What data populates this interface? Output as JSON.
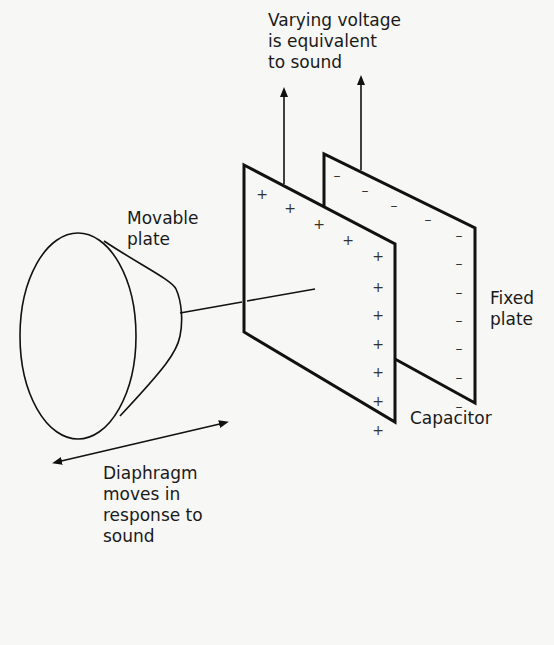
{
  "diagram": {
    "labels": {
      "output": [
        "Varying voltage",
        "is equivalent",
        "to sound"
      ],
      "movable_plate": [
        "Movable",
        "plate"
      ],
      "fixed_plate": [
        "Fixed",
        "plate"
      ],
      "capacitor": "Capacitor",
      "diaphragm": [
        "Diaphragm",
        "moves in",
        "response to",
        "sound"
      ]
    },
    "charges": {
      "movable_plate_sign": "+",
      "movable_plate_count": 11,
      "fixed_plate_sign": "–",
      "fixed_plate_count": 11
    },
    "colors": {
      "ink": "#111111",
      "paper": "#f7f7f5"
    }
  }
}
